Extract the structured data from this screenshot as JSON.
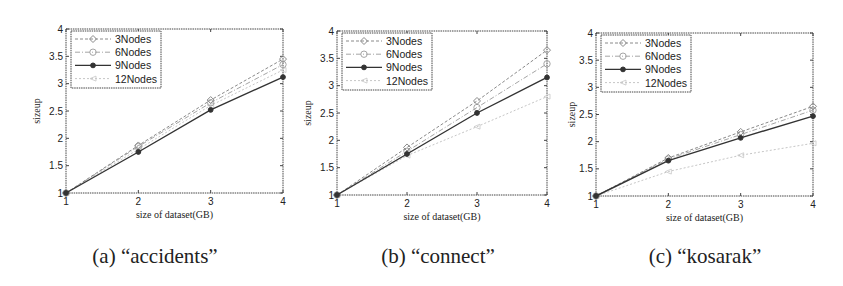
{
  "chart_data": [
    {
      "type": "line",
      "title": "",
      "caption": "(a) “accidents”",
      "xlabel": "size of dataset(GB)",
      "ylabel": "sizeup",
      "x": [
        1,
        2,
        3,
        4
      ],
      "xlim": [
        1,
        4
      ],
      "ylim": [
        1,
        4
      ],
      "xticks": [
        "1",
        "2",
        "3",
        "4"
      ],
      "yticks": [
        "1",
        "1.5",
        "2",
        "2.5",
        "3",
        "3.5",
        "4"
      ],
      "grid": false,
      "legend_position": "upper left",
      "series": [
        {
          "name": "3Nodes",
          "values": [
            1,
            1.87,
            2.7,
            3.45
          ]
        },
        {
          "name": "6Nodes",
          "values": [
            1,
            1.85,
            2.65,
            3.35
          ]
        },
        {
          "name": "9Nodes",
          "values": [
            1,
            1.75,
            2.52,
            3.12
          ]
        },
        {
          "name": "12Nodes",
          "values": [
            1,
            1.8,
            2.6,
            3.25
          ]
        }
      ]
    },
    {
      "type": "line",
      "title": "",
      "caption": "(b) “connect”",
      "xlabel": "size of dataset(GB)",
      "ylabel": "sizeup",
      "x": [
        1,
        2,
        3,
        4
      ],
      "xlim": [
        1,
        4
      ],
      "ylim": [
        1,
        4
      ],
      "xticks": [
        "1",
        "2",
        "3",
        "4"
      ],
      "yticks": [
        "1",
        "1.5",
        "2",
        "2.5",
        "3",
        "3.5",
        "4"
      ],
      "grid": false,
      "legend_position": "upper left",
      "series": [
        {
          "name": "3Nodes",
          "values": [
            1,
            1.87,
            2.72,
            3.65
          ]
        },
        {
          "name": "6Nodes",
          "values": [
            1,
            1.8,
            2.6,
            3.4
          ]
        },
        {
          "name": "9Nodes",
          "values": [
            1,
            1.75,
            2.5,
            3.15
          ]
        },
        {
          "name": "12Nodes",
          "values": [
            1,
            1.72,
            2.25,
            2.8
          ]
        }
      ]
    },
    {
      "type": "line",
      "title": "",
      "caption": "(c) “kosarak”",
      "xlabel": "size of dataset(GB)",
      "ylabel": "sizeup",
      "x": [
        1,
        2,
        3,
        4
      ],
      "xlim": [
        1,
        4
      ],
      "ylim": [
        1,
        4
      ],
      "xticks": [
        "1",
        "2",
        "3",
        "4"
      ],
      "yticks": [
        "1",
        "1.5",
        "2",
        "2.5",
        "3",
        "3.5",
        "4"
      ],
      "grid": false,
      "legend_position": "upper left",
      "series": [
        {
          "name": "3Nodes",
          "values": [
            1,
            1.7,
            2.18,
            2.65
          ]
        },
        {
          "name": "6Nodes",
          "values": [
            1,
            1.68,
            2.13,
            2.58
          ]
        },
        {
          "name": "9Nodes",
          "values": [
            1,
            1.65,
            2.07,
            2.47
          ]
        },
        {
          "name": "12Nodes",
          "values": [
            1,
            1.45,
            1.75,
            1.97
          ]
        }
      ]
    }
  ],
  "series_styles": [
    {
      "color": "#8a8a8a",
      "dash": "3,2",
      "width": 1,
      "marker": "diamond"
    },
    {
      "color": "#a5a5a5",
      "dash": "5,2,1,2",
      "width": 1,
      "marker": "circle"
    },
    {
      "color": "#333333",
      "dash": "",
      "width": 1.4,
      "marker": "dot"
    },
    {
      "color": "#c6c6c6",
      "dash": "2,2",
      "width": 1,
      "marker": "tri"
    }
  ],
  "panels": [
    {
      "left": 66,
      "top": 29,
      "right": 283,
      "bottom": 193,
      "ylabel_x": 40,
      "caption_x": 155
    },
    {
      "left": 337,
      "top": 31,
      "right": 547,
      "bottom": 195,
      "ylabel_x": 311,
      "caption_x": 438
    },
    {
      "left": 596,
      "top": 33,
      "right": 813,
      "bottom": 196,
      "ylabel_x": 575,
      "caption_x": 705
    }
  ]
}
